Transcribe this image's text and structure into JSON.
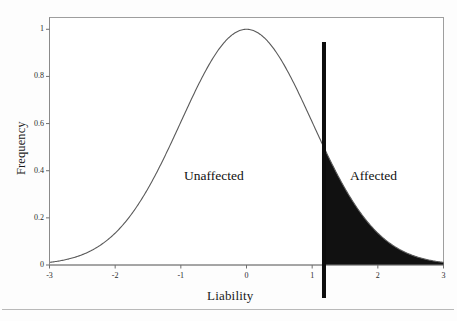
{
  "chart_data": {
    "type": "area",
    "title": "",
    "subtitle": "",
    "xlabel": "Liability",
    "ylabel": "Frequency",
    "xlim": [
      -3,
      3
    ],
    "ylim": [
      0,
      1.05
    ],
    "xticks": [
      -3,
      -2,
      -1,
      0,
      1,
      2,
      3
    ],
    "xtick_labels": [
      "-3",
      "-2",
      "-1",
      "0",
      "1",
      "2",
      "3"
    ],
    "yticks": [
      0,
      0.2,
      0.4,
      0.6,
      0.8,
      1
    ],
    "ytick_labels": [
      "0",
      "0.2",
      "0.4",
      "0.6",
      "0.8",
      "1"
    ],
    "grid": false,
    "legend": false,
    "legend_position": "none",
    "series": [
      {
        "name": "Liability distribution",
        "type": "line",
        "description": "Standard normal density scaled to peak 1.0 at x = 0",
        "color": "#4a4a4a",
        "mean": 0,
        "sd": 1,
        "peak_value": 1.0,
        "x": [
          -3.0,
          -2.8,
          -2.6,
          -2.4,
          -2.2,
          -2.0,
          -1.8,
          -1.6,
          -1.4,
          -1.2,
          -1.0,
          -0.8,
          -0.6,
          -0.4,
          -0.2,
          0.0,
          0.2,
          0.4,
          0.6,
          0.8,
          1.0,
          1.2,
          1.4,
          1.6,
          1.8,
          2.0,
          2.2,
          2.4,
          2.6,
          2.8,
          3.0
        ],
        "values": [
          0.011,
          0.02,
          0.034,
          0.056,
          0.089,
          0.135,
          0.198,
          0.278,
          0.375,
          0.487,
          0.607,
          0.726,
          0.835,
          0.923,
          0.98,
          1.0,
          0.98,
          0.923,
          0.835,
          0.726,
          0.607,
          0.487,
          0.375,
          0.278,
          0.198,
          0.135,
          0.089,
          0.056,
          0.034,
          0.02,
          0.011
        ]
      }
    ],
    "shaded_region": {
      "name": "Affected tail",
      "fill_color": "#111111",
      "x_from": 1.18,
      "x_to": 3.0,
      "description": "Area under the curve to the right of the liability threshold"
    },
    "threshold": {
      "name": "Liability threshold",
      "x_value": 1.18,
      "color": "#0d0d0d",
      "line_width": 4,
      "style": "solid"
    },
    "annotations": [
      {
        "text": "Unaffected",
        "x": -0.1,
        "y": 0.42
      },
      {
        "text": "Affected",
        "x": 2.1,
        "y": 0.42
      }
    ],
    "frame_color": "#9a9a9a",
    "background_color": "#ffffff"
  },
  "figure": {
    "axis_labels": {
      "y": "Frequency",
      "x": "Liability"
    },
    "region_labels": {
      "unaffected": "Unaffected",
      "affected": "Affected"
    }
  }
}
